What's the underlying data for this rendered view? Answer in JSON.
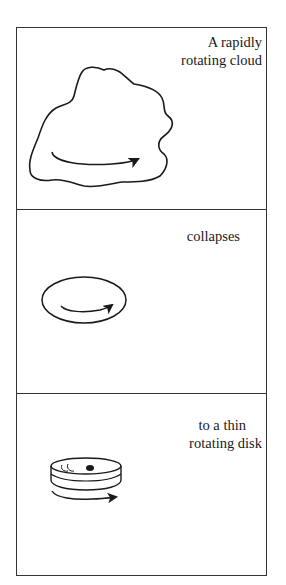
{
  "diagram": {
    "type": "sequence-of-panels",
    "panels": [
      {
        "caption_lines": [
          "A rapidly",
          "rotating cloud"
        ],
        "figure": "irregular-cloud-with-rotation-arrow"
      },
      {
        "caption_lines": [
          "collapses"
        ],
        "figure": "ellipse-with-rotation-arrow"
      },
      {
        "caption_lines": [
          "to a thin",
          "rotating disk"
        ],
        "figure": "thin-disk-with-rotation-arrow"
      }
    ]
  },
  "colors": {
    "stroke": "#1a1a1a",
    "background": "#ffffff",
    "frame": "#333333"
  }
}
